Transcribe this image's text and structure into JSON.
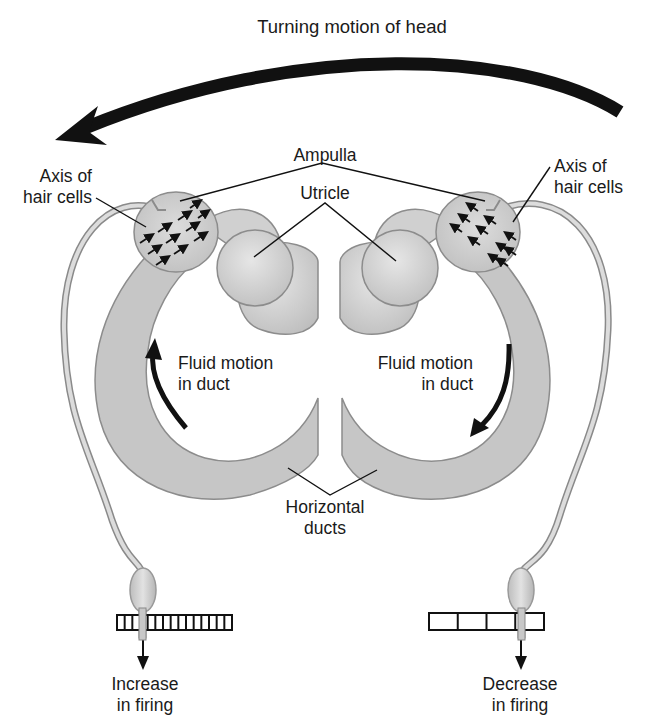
{
  "title": "Turning motion of head",
  "labels": {
    "ampulla": "Ampulla",
    "utricle": "Utricle",
    "axis_left": [
      "Axis of",
      "hair cells"
    ],
    "axis_right": [
      "Axis of",
      "hair cells"
    ],
    "fluid_left": [
      "Fluid motion",
      "in duct"
    ],
    "fluid_right": [
      "Fluid motion",
      "in duct"
    ],
    "horizontal_ducts": [
      "Horizontal",
      "ducts"
    ],
    "increase": [
      "Increase",
      "in firing"
    ],
    "decrease": [
      "Decrease",
      "in firing"
    ]
  },
  "spike_trains": {
    "left_ticks": 15,
    "right_ticks": 4
  },
  "colors": {
    "duct_fill": "#c8c8c8",
    "duct_stroke": "#8a8a8a",
    "utricle_fill": "#d2d2d2",
    "ink": "#111111",
    "text": "#1a1a1a"
  }
}
